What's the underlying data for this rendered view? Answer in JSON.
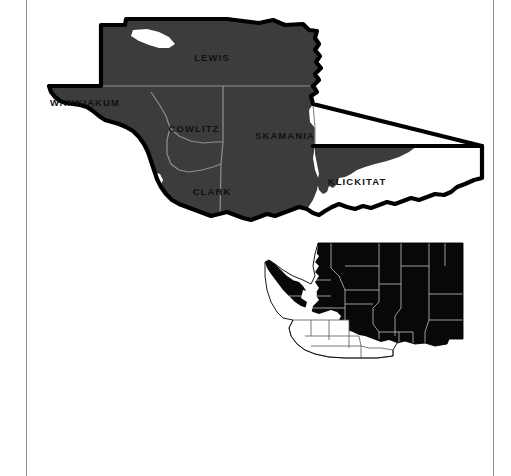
{
  "figure": {
    "main_map": {
      "name": "southwest-washington-counties",
      "region_label": "Southwest Washington",
      "shaded_fill": "#3c3c3c",
      "outline_color": "#000000",
      "unshaded_fill": "#ffffff",
      "county_border_color": "#8f8f8f",
      "counties": [
        {
          "name": "LEWIS",
          "label_x": 185,
          "label_y": 55,
          "shaded": true
        },
        {
          "name": "WAHKIAKUM",
          "label_x": 57,
          "label_y": 100,
          "shaded": true
        },
        {
          "name": "COWLITZ",
          "label_x": 167,
          "label_y": 126,
          "shaded": true
        },
        {
          "name": "SKAMANIA",
          "label_x": 257,
          "label_y": 133,
          "shaded": true
        },
        {
          "name": "CLARK",
          "label_x": 185,
          "label_y": 189,
          "shaded": true
        },
        {
          "name": "KLICKITAT",
          "label_x": 330,
          "label_y": 179,
          "shaded": true
        }
      ]
    },
    "inset_map": {
      "name": "washington-state-locator",
      "state": "Washington",
      "state_fill": "#080808",
      "highlight_fill": "#ffffff",
      "border_color": "#ffffff",
      "outline_color": "#000000",
      "highlighted_region": "Southwest Washington counties"
    }
  },
  "page": {
    "rule_color": "#8d8d8d",
    "background": "#ffffff"
  }
}
